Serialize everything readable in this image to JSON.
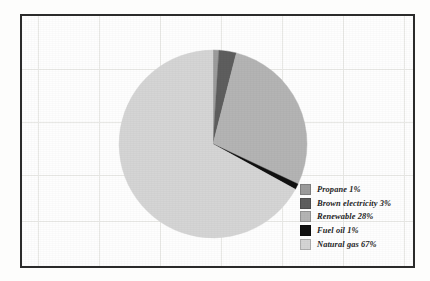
{
  "figure": {
    "background_color": "#fefefe",
    "frame_color": "#2b2b2b",
    "gridline_color": "#e9e9e6",
    "grid_vertical_x": [
      16,
      77,
      138,
      199,
      260,
      321,
      382
    ],
    "grid_horizontal_y": [
      53,
      106,
      159,
      205
    ]
  },
  "legend": {
    "position": "bottom-right",
    "items": [
      {
        "label": "Propane  1%",
        "color": "#9c9c9c"
      },
      {
        "label": "Brown electricity  3%",
        "color": "#5e5e5e"
      },
      {
        "label": "Renewable  28%",
        "color": "#b4b4b4"
      },
      {
        "label": "Fuel oil  1%",
        "color": "#111111"
      },
      {
        "label": "Natural gas  67%",
        "color": "#d5d5d5"
      }
    ]
  },
  "chart_data": {
    "type": "pie",
    "title": "",
    "subtitle": "",
    "xlabel": "",
    "ylabel": "",
    "grid": true,
    "legend_position": "bottom-right",
    "units": "percent",
    "start_angle_deg": 0,
    "direction": "clockwise",
    "center_px": [
      191,
      128
    ],
    "radius_px": 94,
    "labels": [
      "Propane",
      "Brown electricity",
      "Renewable",
      "Fuel oil",
      "Natural gas"
    ],
    "values": [
      1,
      3,
      28,
      1,
      67
    ],
    "colors": [
      "#9c9c9c",
      "#5e5e5e",
      "#b4b4b4",
      "#111111",
      "#d5d5d5"
    ],
    "slices": [
      {
        "name": "Propane",
        "value": 1,
        "display": "1%",
        "color": "#9c9c9c"
      },
      {
        "name": "Brown electricity",
        "value": 3,
        "display": "3%",
        "color": "#5e5e5e"
      },
      {
        "name": "Renewable",
        "value": 28,
        "display": "28%",
        "color": "#b4b4b4"
      },
      {
        "name": "Fuel oil",
        "value": 1,
        "display": "1%",
        "color": "#111111"
      },
      {
        "name": "Natural gas",
        "value": 67,
        "display": "67%",
        "color": "#d5d5d5"
      }
    ]
  }
}
